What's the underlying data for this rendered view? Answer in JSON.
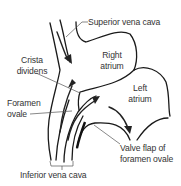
{
  "diagram": {
    "labels": {
      "superior_vena_cava": "Superior vena cava",
      "right_atrium_1": "Right",
      "right_atrium_2": "atrium",
      "crista_1": "Crista",
      "crista_2": "dividens",
      "foramen_1": "Foramen",
      "foramen_2": "ovale",
      "left_atrium_1": "Left",
      "left_atrium_2": "atrium",
      "valve_1": "Valve flap of",
      "valve_2": "foramen ovale",
      "inferior_vena_cava": "Inferior vena cava"
    },
    "colors": {
      "line": "#1a1a1a",
      "leader": "#555555",
      "text": "#333333",
      "background": "#ffffff"
    }
  }
}
